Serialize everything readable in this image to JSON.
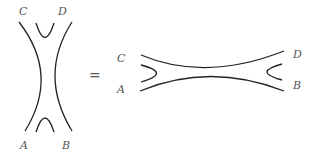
{
  "left_diagram": {
    "labels": {
      "top_left": "C",
      "top_right": "D",
      "bottom_left": "A",
      "bottom_right": "B"
    }
  },
  "relation": "=",
  "right_diagram": {
    "labels": {
      "top_left": "C",
      "bottom_left": "A",
      "top_right": "D",
      "bottom_right": "B"
    }
  }
}
